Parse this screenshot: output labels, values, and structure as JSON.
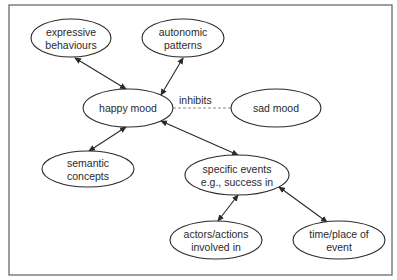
{
  "diagram": {
    "type": "concept-network",
    "colors": {
      "stroke": "#2a2a2a",
      "frame": "#6a6a6a",
      "dashed": "#8a8a8a",
      "background": "#ffffff"
    },
    "nodes": [
      {
        "id": "expressive",
        "lines": [
          "expressive",
          "behaviours"
        ],
        "cx": 71,
        "cy": 38,
        "rx": 40,
        "ry": 19
      },
      {
        "id": "autonomic",
        "lines": [
          "autonomic",
          "patterns"
        ],
        "cx": 183,
        "cy": 38,
        "rx": 41,
        "ry": 19
      },
      {
        "id": "happy",
        "lines": [
          "happy mood"
        ],
        "cx": 128,
        "cy": 108,
        "rx": 45,
        "ry": 19
      },
      {
        "id": "sad",
        "lines": [
          "sad mood"
        ],
        "cx": 276,
        "cy": 108,
        "rx": 45,
        "ry": 19
      },
      {
        "id": "semantic",
        "lines": [
          "semantic",
          "concepts"
        ],
        "cx": 88,
        "cy": 169,
        "rx": 46,
        "ry": 18
      },
      {
        "id": "specific",
        "lines": [
          "specific events",
          "e.g., success in"
        ],
        "cx": 237,
        "cy": 175,
        "rx": 52,
        "ry": 20
      },
      {
        "id": "actors",
        "lines": [
          "actors/actions",
          "involved in"
        ],
        "cx": 216,
        "cy": 240,
        "rx": 46,
        "ry": 19
      },
      {
        "id": "timeplace",
        "lines": [
          "time/place of",
          "event"
        ],
        "cx": 339,
        "cy": 240,
        "rx": 46,
        "ry": 19
      }
    ],
    "edges": [
      {
        "from": "expressive",
        "to": "happy",
        "style": "double-arrow",
        "x1": 75,
        "y1": 58,
        "x2": 126,
        "y2": 89
      },
      {
        "from": "autonomic",
        "to": "happy",
        "style": "double-arrow",
        "x1": 183,
        "y1": 58,
        "x2": 161,
        "y2": 95
      },
      {
        "from": "happy",
        "to": "sad",
        "style": "dashed",
        "label": "inhibits",
        "x1": 173,
        "y1": 108,
        "x2": 231,
        "y2": 108,
        "label_x": 179,
        "label_y": 104
      },
      {
        "from": "happy",
        "to": "semantic",
        "style": "double-arrow",
        "x1": 126,
        "y1": 127,
        "x2": 89,
        "y2": 151
      },
      {
        "from": "happy",
        "to": "specific",
        "style": "double-arrow",
        "x1": 161,
        "y1": 121,
        "x2": 238,
        "y2": 155
      },
      {
        "from": "specific",
        "to": "actors",
        "style": "double-arrow",
        "x1": 238,
        "y1": 195,
        "x2": 218,
        "y2": 221
      },
      {
        "from": "specific",
        "to": "timeplace",
        "style": "double-arrow",
        "x1": 279,
        "y1": 187,
        "x2": 327,
        "y2": 222
      }
    ]
  }
}
